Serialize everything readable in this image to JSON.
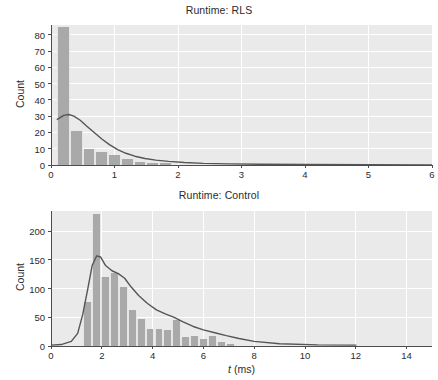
{
  "figure": {
    "background": "#ffffff",
    "plot_background": "#eaeaea",
    "grid_color": "#ffffff",
    "bar_color": "#a9a9a9",
    "kde_color": "#555555",
    "axis_color": "#4d4d4d"
  },
  "panels": [
    {
      "id": "rls",
      "title": "Runtime: RLS",
      "ylabel": "Count",
      "xlabel": "",
      "ytick_labels": [
        "0",
        "10",
        "20",
        "30",
        "40",
        "50",
        "60",
        "70",
        "80"
      ],
      "xtick_labels": [
        "0",
        "1",
        "2",
        "3",
        "4",
        "5",
        "6"
      ]
    },
    {
      "id": "control",
      "title": "Runtime: Control",
      "ylabel": "Count",
      "xlabel_prefix": "t",
      "xlabel_suffix": " (ms)",
      "ytick_labels": [
        "0",
        "50",
        "100",
        "150",
        "200"
      ],
      "xtick_labels": [
        "0",
        "2",
        "4",
        "6",
        "8",
        "10",
        "12",
        "14"
      ]
    }
  ],
  "chart_data": [
    {
      "type": "bar",
      "id": "rls",
      "title": "Runtime: RLS",
      "xlabel": "",
      "ylabel": "Count",
      "xlim": [
        0,
        6
      ],
      "ylim": [
        0,
        86
      ],
      "yticks": [
        0,
        10,
        20,
        30,
        40,
        50,
        60,
        70,
        80
      ],
      "xticks": [
        0,
        1,
        2,
        3,
        4,
        5,
        6
      ],
      "grid": true,
      "legend": "none",
      "bin_width": 0.2,
      "bin_edges": [
        0.1,
        0.3,
        0.5,
        0.7,
        0.9,
        1.1,
        1.3,
        1.5,
        1.7,
        1.9,
        2.1,
        2.3,
        2.5,
        2.7,
        2.9
      ],
      "bin_centers": [
        0.2,
        0.4,
        0.6,
        0.8,
        1.0,
        1.2,
        1.4,
        1.6,
        1.8,
        2.0,
        2.2,
        2.4,
        2.6,
        2.8
      ],
      "values": [
        85,
        21,
        10,
        8,
        6,
        4,
        2,
        1,
        1,
        0,
        0,
        0,
        0,
        0
      ],
      "overlay": {
        "type": "line",
        "name": "kde",
        "x": [
          0.1,
          0.2,
          0.28,
          0.36,
          0.46,
          0.56,
          0.68,
          0.8,
          0.92,
          1.05,
          1.18,
          1.32,
          1.48,
          1.65,
          1.85,
          2.1,
          2.4,
          2.8,
          3.3,
          4.0,
          5.0,
          6.0
        ],
        "y": [
          28.0,
          30.5,
          31.0,
          30.0,
          27.5,
          24.0,
          20.0,
          16.0,
          12.5,
          9.5,
          7.2,
          5.4,
          4.0,
          3.0,
          2.2,
          1.5,
          1.0,
          0.7,
          0.5,
          0.3,
          0.2,
          0.1
        ]
      }
    },
    {
      "type": "bar",
      "id": "control",
      "title": "Runtime: Control",
      "xlabel": "t (ms)",
      "ylabel": "Count",
      "xlim": [
        0,
        15
      ],
      "ylim": [
        0,
        235
      ],
      "yticks": [
        0,
        50,
        100,
        150,
        200
      ],
      "xticks": [
        0,
        2,
        4,
        6,
        8,
        10,
        12,
        14
      ],
      "grid": true,
      "legend": "none",
      "bin_width": 0.35,
      "bin_centers": [
        1.45,
        1.8,
        2.15,
        2.5,
        2.85,
        3.2,
        3.55,
        3.9,
        4.25,
        4.6,
        4.95,
        5.3,
        5.65,
        6.0,
        6.35,
        6.7,
        7.05
      ],
      "values": [
        77,
        229,
        121,
        127,
        102,
        63,
        47,
        29,
        30,
        28,
        46,
        16,
        17,
        13,
        17,
        7,
        3
      ],
      "overlay": {
        "type": "line",
        "name": "kde",
        "x": [
          0.0,
          0.4,
          0.8,
          1.05,
          1.25,
          1.45,
          1.62,
          1.8,
          1.95,
          2.15,
          2.4,
          2.65,
          2.9,
          3.15,
          3.45,
          3.8,
          4.15,
          4.5,
          4.85,
          5.2,
          5.6,
          6.0,
          6.45,
          6.9,
          7.4,
          8.0,
          9.0,
          10.5,
          12.0
        ],
        "y": [
          1.5,
          2.5,
          8.0,
          22.0,
          55.0,
          100.0,
          140.0,
          157.0,
          155.0,
          140.0,
          131.0,
          126.0,
          118.0,
          103.0,
          88.0,
          74.0,
          63.0,
          56.0,
          50.0,
          42.0,
          34.0,
          28.0,
          23.0,
          18.0,
          13.0,
          8.0,
          4.0,
          2.0,
          1.5
        ]
      }
    }
  ]
}
